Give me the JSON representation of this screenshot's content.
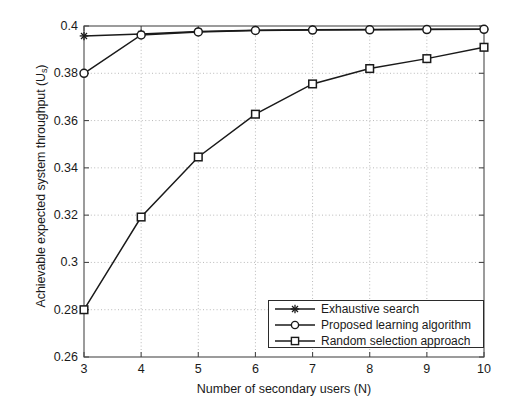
{
  "chart_data": {
    "type": "line",
    "title": "",
    "xlabel": "Number of secondary users (N)",
    "ylabel": "Achievable expected system throughput (U",
    "ylabel_sub": "s",
    "ylabel_suffix": ")",
    "x": [
      3,
      4,
      5,
      6,
      7,
      8,
      9,
      10
    ],
    "xlim": [
      3,
      10
    ],
    "ylim": [
      0.26,
      0.4
    ],
    "xticks": [
      "3",
      "4",
      "5",
      "6",
      "7",
      "8",
      "9",
      "10"
    ],
    "yticks": [
      "0.26",
      "0.28",
      "0.3",
      "0.32",
      "0.34",
      "0.36",
      "0.38",
      "0.4"
    ],
    "ytick_values": [
      0.26,
      0.28,
      0.3,
      0.32,
      0.34,
      0.36,
      0.38,
      0.4
    ],
    "grid": true,
    "legend_position": "lower right",
    "series": [
      {
        "name": "Exhaustive search",
        "marker": "star",
        "color": "#1a1a1a",
        "values": [
          0.3958,
          0.3966,
          0.3977,
          0.3982,
          0.3984,
          0.3985,
          0.3986,
          0.3986
        ]
      },
      {
        "name": "Proposed learning algorithm",
        "marker": "circle",
        "color": "#1a1a1a",
        "values": [
          0.38,
          0.3962,
          0.3975,
          0.3981,
          0.3983,
          0.3984,
          0.3985,
          0.3986
        ]
      },
      {
        "name": "Random selection approach",
        "marker": "square",
        "color": "#1a1a1a",
        "values": [
          0.28,
          0.3192,
          0.3446,
          0.3627,
          0.3755,
          0.382,
          0.3862,
          0.391
        ]
      }
    ]
  }
}
